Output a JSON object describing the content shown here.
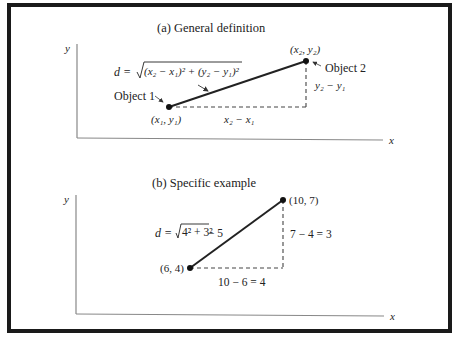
{
  "figure": {
    "panel_a": {
      "title": "(a)  General definition",
      "axis_y_label": "y",
      "axis_x_label": "x",
      "formula_prefix": "d = ",
      "formula_radicand": "(x₂ − x₁)² + (y₂ − y₁)²",
      "point1_label": "Object 1",
      "point1_coords": "(x₁, y₁)",
      "point2_label": "Object 2",
      "point2_coords": "(x₂, y₂)",
      "horizontal_leg_label": "x₂ − x₁",
      "vertical_leg_label": "y₂ − y₁"
    },
    "panel_b": {
      "title": "(b)  Specific example",
      "axis_y_label": "y",
      "axis_x_label": "x",
      "formula_prefix": "d = ",
      "formula_radicand": "4² + 3²",
      "formula_suffix": " − 5",
      "point1_coords": "(6, 4)",
      "point2_coords": "(10, 7)",
      "horizontal_leg_label": "10 − 6 = 4",
      "vertical_leg_label": "7 − 4 = 3"
    },
    "colors": {
      "ink": "#222222",
      "frame": "#1a1a1a",
      "axis": "#888888",
      "background": "#ffffff"
    }
  }
}
